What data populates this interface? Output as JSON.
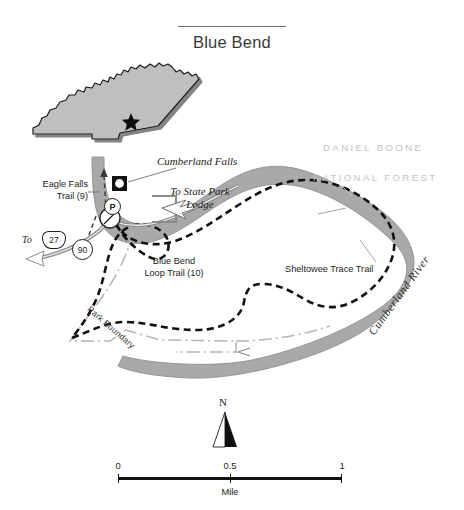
{
  "title": {
    "text": "Blue Bend"
  },
  "inset": {
    "name": "kentucky-state-inset",
    "marker": "star"
  },
  "labels": {
    "forest_line1": "DANIEL BOONE",
    "forest_line2": "NATIONAL FOREST",
    "cumberland_falls": "Cumberland Falls",
    "to_state_park_lodge_line1": "To State Park",
    "to_state_park_lodge_line2": "Lodge",
    "eagle_falls_line1": "Eagle Falls",
    "eagle_falls_line2": "Trail (9)",
    "blue_bend_line1": "Blue Bend",
    "blue_bend_line2": "Loop Trail (10)",
    "sheltowee": "Sheltowee Trace Trail",
    "cumberland_river": "Cumberland River",
    "park_boundary": "Park Boundary"
  },
  "markers": {
    "to_27_prefix": "To",
    "route_us_27": "27",
    "route_ky_90": "90",
    "parking": "P"
  },
  "north_arrow": {
    "label": "N"
  },
  "scale": {
    "ticks": [
      "0",
      "0.5",
      "1"
    ],
    "unit": "Mile"
  },
  "colors": {
    "river": "#a9a9a9",
    "river_stroke": "#8e8e8e",
    "trail": "#111111",
    "boundary": "#b4b4b4",
    "forest_text": "#c3c3c3",
    "inset_fill": "#bfbfbf",
    "text": "#1d1d1d"
  }
}
